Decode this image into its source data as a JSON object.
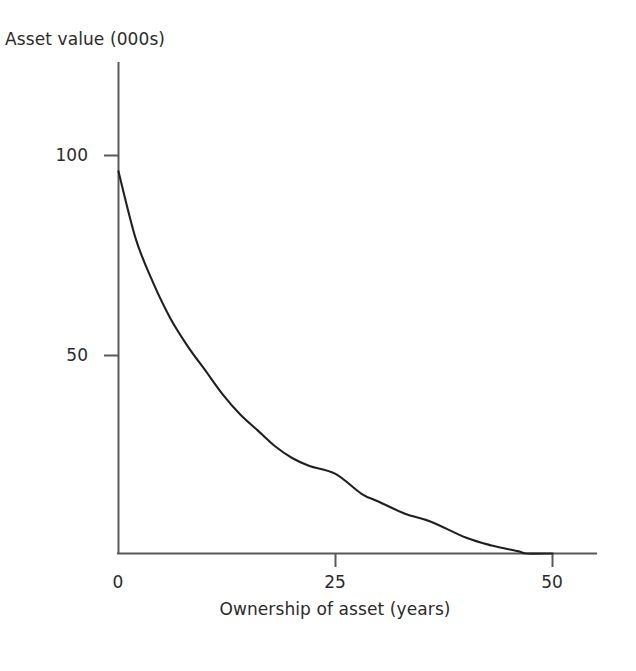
{
  "chart_data": {
    "type": "line",
    "title": "",
    "xlabel": "Ownership of asset (years)",
    "ylabel": "Asset value (000s)",
    "xlim": [
      0,
      55
    ],
    "ylim": [
      0,
      112
    ],
    "xticks": [
      "0",
      "25",
      "50"
    ],
    "xtick_values": [
      0,
      25,
      50
    ],
    "yticks": [
      "100",
      "50"
    ],
    "ytick_values": [
      100,
      50
    ],
    "grid": false,
    "legend": null,
    "series": [
      {
        "name": "Asset value",
        "color": "#231f20",
        "x": [
          0,
          2,
          4,
          6,
          8,
          10,
          12,
          14,
          16,
          18,
          20,
          22,
          25,
          28,
          30,
          33,
          36,
          40,
          43,
          46,
          47,
          50
        ],
        "values": [
          96,
          79,
          68,
          59,
          52,
          46,
          40,
          35,
          31,
          27,
          24,
          22,
          20,
          15,
          13,
          10,
          8,
          4,
          2,
          0.6,
          0,
          0
        ]
      }
    ]
  },
  "axis": {
    "y_tick_100_label": "100",
    "y_tick_50_label": "50",
    "x_tick_0_label": "0",
    "x_tick_25_label": "25",
    "x_tick_50_label": "50"
  },
  "labels": {
    "y_axis_title": "Asset value (000s)",
    "x_axis_title": "Ownership of asset (years)"
  },
  "colors": {
    "background": "#ffffff",
    "axis": "#58595b",
    "curve": "#231f20",
    "text": "#2b2b2b"
  }
}
